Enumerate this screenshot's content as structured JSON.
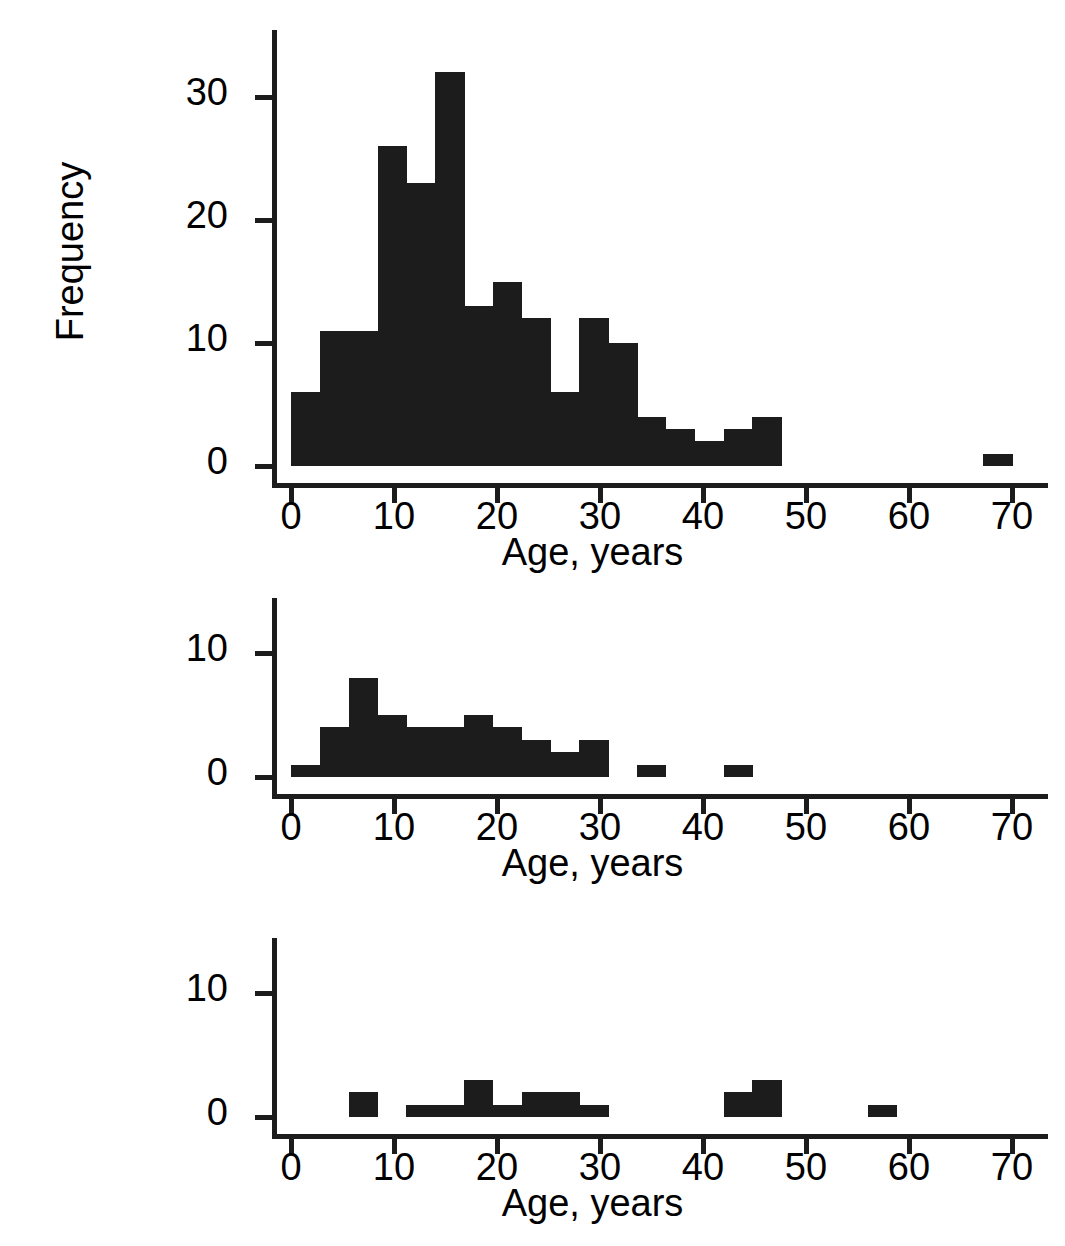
{
  "figure": {
    "background": "#ffffff",
    "ink_color": "#1c1c1c",
    "ylabel": "Frequency"
  },
  "chart_data": [
    {
      "type": "bar",
      "id": "panel-1",
      "title": "",
      "xlabel": "Age, years",
      "ylabel": "Frequency",
      "xlim": [
        0,
        73
      ],
      "ylim": [
        0,
        35
      ],
      "xticks": [
        0,
        10,
        20,
        30,
        40,
        50,
        60,
        70
      ],
      "yticks": [
        0,
        10,
        20,
        30
      ],
      "xticklabels": [
        "0",
        "10",
        "20",
        "30",
        "40",
        "50",
        "60",
        "70"
      ],
      "yticklabels": [
        "0",
        "10",
        "20",
        "30"
      ],
      "grid": false,
      "legend": null,
      "bin_width": 2.8,
      "bin_starts": [
        0.0,
        2.8,
        5.6,
        8.4,
        11.2,
        14.0,
        16.8,
        19.6,
        22.4,
        25.2,
        28.0,
        30.8,
        33.6,
        36.4,
        39.2,
        42.0,
        44.8,
        67.2
      ],
      "values": [
        6,
        11,
        11,
        26,
        23,
        32,
        13,
        15,
        12,
        6,
        12,
        10,
        4,
        3,
        2,
        3,
        4,
        1
      ]
    },
    {
      "type": "bar",
      "id": "panel-2",
      "title": "",
      "xlabel": "Age, years",
      "ylabel": "",
      "xlim": [
        0,
        73
      ],
      "ylim": [
        0,
        14
      ],
      "xticks": [
        0,
        10,
        20,
        30,
        40,
        50,
        60,
        70
      ],
      "yticks": [
        0,
        10
      ],
      "xticklabels": [
        "0",
        "10",
        "20",
        "30",
        "40",
        "50",
        "60",
        "70"
      ],
      "yticklabels": [
        "0",
        "10"
      ],
      "grid": false,
      "legend": null,
      "bin_width": 2.8,
      "bin_starts": [
        0.0,
        2.8,
        5.6,
        8.4,
        11.2,
        14.0,
        16.8,
        19.6,
        22.4,
        25.2,
        28.0,
        33.6,
        42.0
      ],
      "values": [
        1,
        4,
        8,
        5,
        4,
        4,
        5,
        4,
        3,
        2,
        3,
        1,
        1
      ]
    },
    {
      "type": "bar",
      "id": "panel-3",
      "title": "",
      "xlabel": "Age, years",
      "ylabel": "",
      "xlim": [
        0,
        73
      ],
      "ylim": [
        0,
        14
      ],
      "xticks": [
        0,
        10,
        20,
        30,
        40,
        50,
        60,
        70
      ],
      "yticks": [
        0,
        10
      ],
      "xticklabels": [
        "0",
        "10",
        "20",
        "30",
        "40",
        "50",
        "60",
        "70"
      ],
      "yticklabels": [
        "0",
        "10"
      ],
      "grid": false,
      "legend": null,
      "bin_width": 2.8,
      "bin_starts": [
        5.6,
        11.2,
        14.0,
        16.8,
        19.6,
        22.4,
        25.2,
        28.0,
        42.0,
        44.8,
        56.0
      ],
      "values": [
        2,
        1,
        1,
        3,
        1,
        2,
        2,
        1,
        2,
        3,
        1
      ]
    }
  ]
}
